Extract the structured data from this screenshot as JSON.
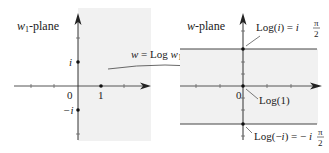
{
  "left_plane": {
    "title": "w₁-plane",
    "title_var": "w",
    "title_sub": "1",
    "title_suffix": "-plane",
    "origin_label": "0",
    "point_one_label": "1",
    "i_label": "i",
    "minus_i_label": "−i",
    "shade_color": "#f0f0f0"
  },
  "mapping": {
    "label": "w = Log w₁",
    "label_prefix": "w = Log w",
    "label_sub": "1"
  },
  "right_plane": {
    "title": "w-plane",
    "origin_label": "0",
    "log_i_label": "Log(i) = i",
    "log_i_frac_num": "π",
    "log_i_frac_den": "2",
    "log_one_label": "Log(1)",
    "log_minus_i_label": "Log(−i) = − i",
    "log_minus_i_frac_num": "π",
    "log_minus_i_frac_den": "2",
    "shade_color": "#f0f0f0"
  },
  "colors": {
    "axis": "#333333",
    "line": "#444444",
    "text": "#222222"
  }
}
